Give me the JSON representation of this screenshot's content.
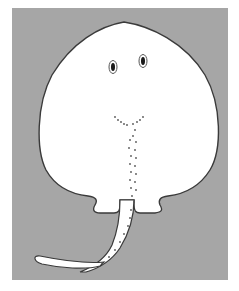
{
  "illustration": {
    "subject": "stingray",
    "view": "ventral / top-down cartoon",
    "colors": {
      "background": "#a6a6a6",
      "body": "#ffffff",
      "outline": "#3a3a3a",
      "eye": "#1a1a1a",
      "dots": "#555555"
    }
  }
}
